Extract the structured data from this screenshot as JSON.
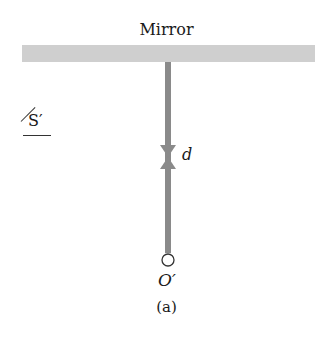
{
  "diagram": {
    "mirror_label": "Mirror",
    "frame_label": "S′",
    "distance_label": "d",
    "origin_label": "O′",
    "caption": "(a)",
    "colors": {
      "mirror": "#cfcfcf",
      "rod": "#8a8a8a",
      "text": "#1a1a1a"
    }
  }
}
